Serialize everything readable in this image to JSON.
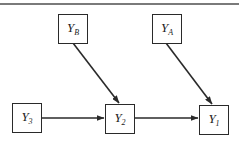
{
  "diagram": {
    "type": "path-diagram",
    "nodes": [
      {
        "id": "YB",
        "base": "Y",
        "sub": "B",
        "x": 58,
        "y": 14
      },
      {
        "id": "YA",
        "base": "Y",
        "sub": "A",
        "x": 152,
        "y": 14
      },
      {
        "id": "Y3",
        "base": "Y",
        "sub": "3",
        "x": 12,
        "y": 103
      },
      {
        "id": "Y2",
        "base": "Y",
        "sub": "2",
        "x": 105,
        "y": 104
      },
      {
        "id": "Y1",
        "base": "Y",
        "sub": "1",
        "x": 199,
        "y": 105
      }
    ],
    "edges": [
      {
        "from": "YB",
        "to": "Y2"
      },
      {
        "from": "YA",
        "to": "Y1"
      },
      {
        "from": "Y3",
        "to": "Y2"
      },
      {
        "from": "Y2",
        "to": "Y1"
      }
    ],
    "colors": {
      "line": "#2a2a2a",
      "top_rule": "#7a7a7a",
      "background": "#ffffff"
    }
  }
}
